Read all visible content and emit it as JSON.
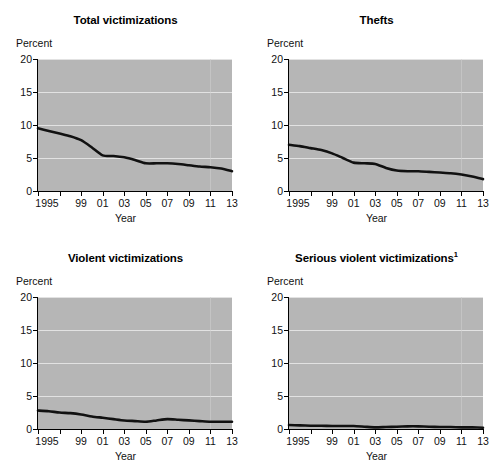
{
  "figure": {
    "background_color": "#ffffff",
    "plot_background_color": "#b6b6b6",
    "gridline_color": "#e2e2e2",
    "line_color": "#111111",
    "axis_label_y": "Percent",
    "axis_label_x": "Year",
    "y_ticks": [
      "0",
      "5",
      "10",
      "15",
      "20"
    ],
    "x_ticks": [
      "1995",
      "",
      "",
      "",
      "99",
      "01",
      "03",
      "05",
      "07",
      "09",
      "11",
      "13"
    ],
    "x_tick_labels_shown": [
      "1995",
      "99",
      "01",
      "03",
      "05",
      "07",
      "09",
      "11",
      "13"
    ]
  },
  "chart_data": [
    {
      "type": "line",
      "title": "Total victimizations",
      "title_superscript": "",
      "xlabel": "Year",
      "ylabel": "Percent",
      "ylim": [
        0,
        20
      ],
      "xlim": [
        1995,
        2013
      ],
      "grid": true,
      "legend": "none",
      "x": [
        1995,
        1996,
        1997,
        1998,
        1999,
        2000,
        2001,
        2002,
        2003,
        2004,
        2005,
        2006,
        2007,
        2008,
        2009,
        2010,
        2011,
        2012,
        2013
      ],
      "values": [
        9.5,
        9.1,
        8.7,
        8.3,
        7.7,
        6.6,
        5.4,
        5.3,
        5.1,
        4.7,
        4.2,
        4.2,
        4.2,
        4.1,
        3.9,
        3.7,
        3.6,
        3.4,
        3.0
      ]
    },
    {
      "type": "line",
      "title": "Thefts",
      "title_superscript": "",
      "xlabel": "Year",
      "ylabel": "Percent",
      "ylim": [
        0,
        20
      ],
      "xlim": [
        1995,
        2013
      ],
      "grid": true,
      "legend": "none",
      "x": [
        1995,
        1996,
        1997,
        1998,
        1999,
        2000,
        2001,
        2002,
        2003,
        2004,
        2005,
        2006,
        2007,
        2008,
        2009,
        2010,
        2011,
        2012,
        2013
      ],
      "values": [
        7.0,
        6.8,
        6.5,
        6.2,
        5.7,
        5.0,
        4.3,
        4.2,
        4.1,
        3.5,
        3.1,
        3.0,
        3.0,
        2.9,
        2.8,
        2.7,
        2.5,
        2.2,
        1.8
      ]
    },
    {
      "type": "line",
      "title": "Violent victimizations",
      "title_superscript": "",
      "xlabel": "Year",
      "ylabel": "Percent",
      "ylim": [
        0,
        20
      ],
      "xlim": [
        1995,
        2013
      ],
      "grid": true,
      "legend": "none",
      "x": [
        1995,
        1996,
        1997,
        1998,
        1999,
        2000,
        2001,
        2002,
        2003,
        2004,
        2005,
        2006,
        2007,
        2008,
        2009,
        2010,
        2011,
        2012,
        2013
      ],
      "values": [
        2.8,
        2.7,
        2.5,
        2.4,
        2.2,
        1.9,
        1.7,
        1.5,
        1.3,
        1.2,
        1.1,
        1.3,
        1.5,
        1.4,
        1.3,
        1.2,
        1.1,
        1.1,
        1.1
      ]
    },
    {
      "type": "line",
      "title": "Serious violent victimizations",
      "title_superscript": "1",
      "xlabel": "Year",
      "ylabel": "Percent",
      "ylim": [
        0,
        20
      ],
      "xlim": [
        1995,
        2013
      ],
      "grid": true,
      "legend": "none",
      "x": [
        1995,
        1996,
        1997,
        1998,
        1999,
        2000,
        2001,
        2002,
        2003,
        2004,
        2005,
        2006,
        2007,
        2008,
        2009,
        2010,
        2011,
        2012,
        2013
      ],
      "values": [
        0.6,
        0.55,
        0.5,
        0.5,
        0.45,
        0.45,
        0.45,
        0.35,
        0.25,
        0.3,
        0.35,
        0.4,
        0.4,
        0.35,
        0.3,
        0.3,
        0.25,
        0.25,
        0.2
      ]
    }
  ]
}
